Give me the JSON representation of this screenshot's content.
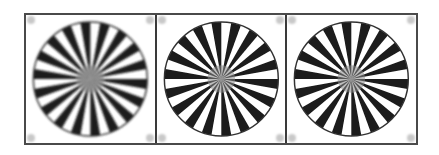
{
  "figure": {
    "panels": [
      {
        "id": "star-1",
        "spokes": 36,
        "blur": 1.1
      },
      {
        "id": "star-2",
        "spokes": 36,
        "blur": 0.5
      },
      {
        "id": "star-3",
        "spokes": 36,
        "blur": 0.8
      }
    ],
    "colors": {
      "spoke": "#1a1a1a",
      "background": "#ffffff",
      "border": "#4a4a4a",
      "corner_marker": "#c8c8c8"
    }
  }
}
